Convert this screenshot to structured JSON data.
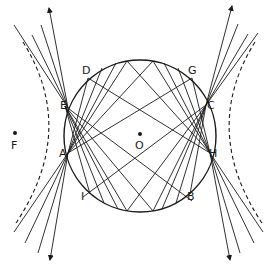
{
  "diagram": {
    "type": "geometry",
    "colors": {
      "stroke": "#1a1a1a",
      "background": "#ffffff"
    },
    "circle": {
      "center_label": "O",
      "cx": 140,
      "cy": 136,
      "r": 76
    },
    "points": {
      "A": {
        "label": "A",
        "x": 68,
        "y": 153
      },
      "B": {
        "label": "B",
        "x": 192,
        "y": 201
      },
      "C": {
        "label": "C",
        "x": 206,
        "y": 105
      },
      "D": {
        "label": "D",
        "x": 88,
        "y": 73
      },
      "E": {
        "label": "E",
        "x": 65,
        "y": 106
      },
      "F": {
        "label": "F",
        "x": 15,
        "y": 135
      },
      "G": {
        "label": "G",
        "x": 193,
        "y": 73
      },
      "H": {
        "label": "H",
        "x": 210,
        "y": 153
      },
      "I": {
        "label": "I",
        "x": 83,
        "y": 197
      },
      "O": {
        "label": "O",
        "x": 140,
        "y": 136
      }
    },
    "labels": [
      {
        "key": "D",
        "text": "D",
        "x": 82,
        "y": 65
      },
      {
        "key": "G",
        "text": "G",
        "x": 188,
        "y": 65
      },
      {
        "key": "E",
        "text": "E",
        "x": 60,
        "y": 101
      },
      {
        "key": "C",
        "text": "C",
        "x": 205,
        "y": 101
      },
      {
        "key": "F",
        "text": "F",
        "x": 11,
        "y": 141
      },
      {
        "key": "O",
        "text": "O",
        "x": 135,
        "y": 141
      },
      {
        "key": "A",
        "text": "A",
        "x": 59,
        "y": 149
      },
      {
        "key": "H",
        "text": "H",
        "x": 209,
        "y": 149
      },
      {
        "key": "I",
        "text": "I",
        "x": 80,
        "y": 191
      },
      {
        "key": "B",
        "text": "B",
        "x": 187,
        "y": 191
      }
    ]
  }
}
